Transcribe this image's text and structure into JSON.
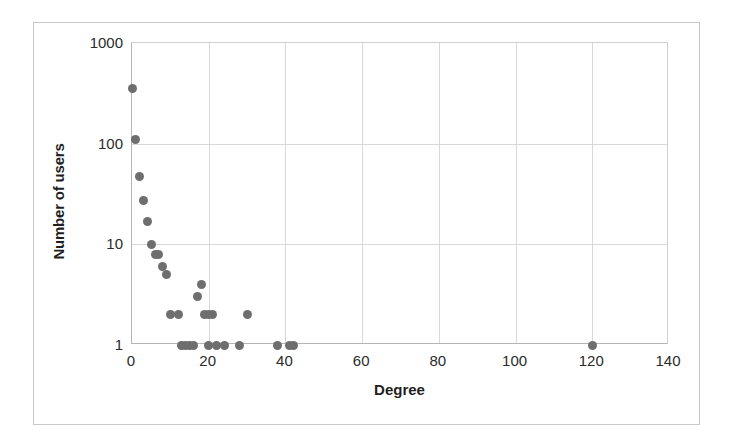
{
  "chart_data": {
    "type": "scatter",
    "title": "",
    "subtitle": "",
    "xlabel": "Degree",
    "ylabel": "Number of users",
    "xlim": [
      0,
      140
    ],
    "ylim": [
      1,
      1000
    ],
    "yscale": "log",
    "xscale": "linear",
    "grid": true,
    "legend": null,
    "xticks": [
      "0",
      "20",
      "40",
      "60",
      "80",
      "100",
      "120",
      "140"
    ],
    "xtick_values": [
      0,
      20,
      40,
      60,
      80,
      100,
      120,
      140
    ],
    "yticks": [
      "1",
      "10",
      "100",
      "1000"
    ],
    "ytick_values": [
      1,
      10,
      100,
      1000
    ],
    "marker": {
      "shape": "circle",
      "color": "#6e6e6e",
      "size": 9
    },
    "points": [
      {
        "x": 0,
        "y": 350
      },
      {
        "x": 1,
        "y": 110
      },
      {
        "x": 2,
        "y": 47
      },
      {
        "x": 3,
        "y": 27
      },
      {
        "x": 4,
        "y": 17
      },
      {
        "x": 5,
        "y": 10
      },
      {
        "x": 6,
        "y": 8
      },
      {
        "x": 7,
        "y": 8
      },
      {
        "x": 8,
        "y": 6
      },
      {
        "x": 9,
        "y": 5
      },
      {
        "x": 10,
        "y": 2
      },
      {
        "x": 12,
        "y": 2
      },
      {
        "x": 13,
        "y": 1
      },
      {
        "x": 14,
        "y": 1
      },
      {
        "x": 15,
        "y": 1
      },
      {
        "x": 16,
        "y": 1
      },
      {
        "x": 17,
        "y": 3
      },
      {
        "x": 18,
        "y": 4
      },
      {
        "x": 19,
        "y": 2
      },
      {
        "x": 20,
        "y": 2
      },
      {
        "x": 20,
        "y": 1
      },
      {
        "x": 22,
        "y": 1
      },
      {
        "x": 21,
        "y": 2
      },
      {
        "x": 24,
        "y": 1
      },
      {
        "x": 28,
        "y": 1
      },
      {
        "x": 30,
        "y": 2
      },
      {
        "x": 38,
        "y": 1
      },
      {
        "x": 41,
        "y": 1
      },
      {
        "x": 42,
        "y": 1
      },
      {
        "x": 120,
        "y": 1
      }
    ]
  },
  "colors": {
    "marker": "#6e6e6e",
    "grid": "#d8d8d8",
    "axis": "#b5b5b5",
    "frame": "#c9c9c9",
    "text": "#1f1f1f",
    "background": "#ffffff"
  }
}
